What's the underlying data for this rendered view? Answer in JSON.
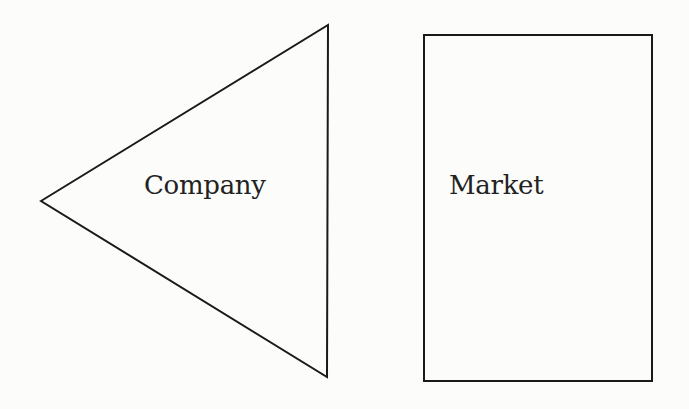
{
  "diagram": {
    "nodes": [
      {
        "id": "company",
        "shape": "triangle-pointing-left",
        "label": "Company",
        "points": [
          [
            41,
            201
          ],
          [
            328,
            25
          ],
          [
            327,
            377
          ]
        ]
      },
      {
        "id": "market",
        "shape": "rectangle",
        "label": "Market",
        "x": 424,
        "y": 35,
        "width": 228,
        "height": 346
      }
    ],
    "stroke_color": "#1a1a1a",
    "background": "#fcfcfb"
  }
}
